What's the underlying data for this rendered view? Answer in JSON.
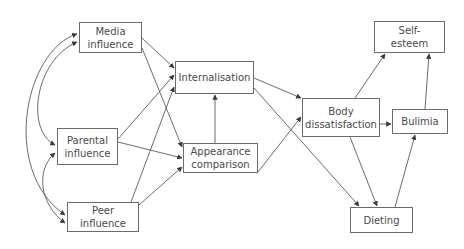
{
  "diagram": {
    "nodes": [
      {
        "id": "media",
        "label": "Media\ninfluence",
        "x": 79,
        "y": 22,
        "w": 63,
        "h": 31
      },
      {
        "id": "parental",
        "label": "Parental\ninfluence",
        "x": 57,
        "y": 128,
        "w": 61,
        "h": 37
      },
      {
        "id": "peer",
        "label": "Peer\ninfluence",
        "x": 67,
        "y": 202,
        "w": 72,
        "h": 30
      },
      {
        "id": "internalisation",
        "label": "Internalisation",
        "x": 175,
        "y": 61,
        "w": 79,
        "h": 33
      },
      {
        "id": "appearance",
        "label": "Appearance\ncomparison",
        "x": 183,
        "y": 143,
        "w": 75,
        "h": 30
      },
      {
        "id": "body",
        "label": "Body\ndissatisfaction",
        "x": 302,
        "y": 98,
        "w": 78,
        "h": 39
      },
      {
        "id": "bulimia",
        "label": "Bulimia",
        "x": 392,
        "y": 109,
        "w": 56,
        "h": 25
      },
      {
        "id": "selfesteem",
        "label": "Self-\nesteem",
        "x": 374,
        "y": 21,
        "w": 71,
        "h": 32
      },
      {
        "id": "dieting",
        "label": "Dieting",
        "x": 350,
        "y": 207,
        "w": 63,
        "h": 26
      }
    ],
    "edges": [
      {
        "from": "media",
        "to": "internalisation"
      },
      {
        "from": "media",
        "to": "appearance"
      },
      {
        "from": "parental",
        "to": "internalisation"
      },
      {
        "from": "parental",
        "to": "appearance"
      },
      {
        "from": "peer",
        "to": "internalisation"
      },
      {
        "from": "peer",
        "to": "appearance"
      },
      {
        "from": "appearance",
        "to": "internalisation"
      },
      {
        "from": "internalisation",
        "to": "body"
      },
      {
        "from": "internalisation",
        "to": "dieting"
      },
      {
        "from": "appearance",
        "to": "body"
      },
      {
        "from": "body",
        "to": "selfesteem"
      },
      {
        "from": "body",
        "to": "bulimia"
      },
      {
        "from": "body",
        "to": "dieting"
      },
      {
        "from": "dieting",
        "to": "bulimia"
      },
      {
        "from": "bulimia",
        "to": "selfesteem"
      }
    ],
    "bidirectional": [
      {
        "a": "media",
        "b": "peer"
      },
      {
        "a": "media",
        "b": "parental"
      },
      {
        "a": "parental",
        "b": "peer"
      }
    ],
    "colors": {
      "line": "#5a5a5a",
      "text": "#4a4a4a",
      "border": "#6b6b6b"
    }
  }
}
